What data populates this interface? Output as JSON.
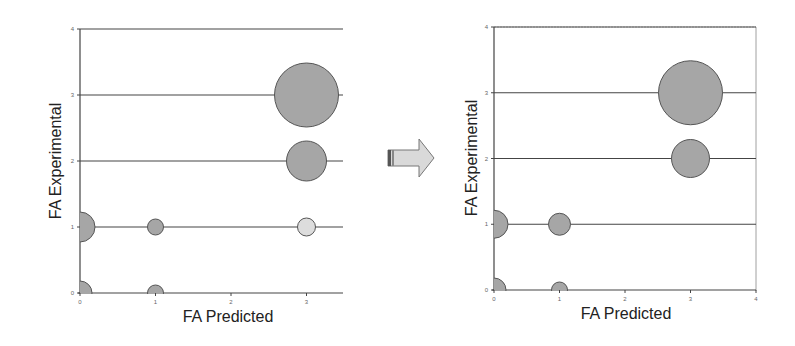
{
  "figure": {
    "arrow_icon": "right-arrow-icon",
    "colors": {
      "bubble_fill": "#a6a6a6",
      "bubble_fill_light": "#dddddd",
      "bubble_stroke": "#555555",
      "gridline": "#444444",
      "axis": "#444444",
      "arrow_fill": "#d9d9d9",
      "arrow_stroke": "#777777"
    }
  },
  "left_chart": {
    "xlabel": "FA Predicted",
    "ylabel": "FA Experimental",
    "xticks": [
      "0",
      "1",
      "2",
      "3"
    ],
    "yticks": [
      "0",
      "1",
      "2",
      "3",
      "4"
    ]
  },
  "right_chart": {
    "xlabel": "FA Predicted",
    "ylabel": "FA Experimental",
    "xticks": [
      "0",
      "1",
      "2",
      "3",
      "4"
    ],
    "yticks": [
      "0",
      "1",
      "2",
      "3",
      "4"
    ]
  },
  "chart_data": [
    {
      "type": "scatter",
      "subtype": "bubble",
      "title": "",
      "xlabel": "FA Predicted",
      "ylabel": "FA Experimental",
      "xlim": [
        0,
        3.5
      ],
      "ylim": [
        0,
        4
      ],
      "xticks": [
        0,
        1,
        2,
        3
      ],
      "yticks": [
        0,
        1,
        2,
        3,
        4
      ],
      "grid": "horizontal",
      "legend": null,
      "points": [
        {
          "x": 0,
          "y": 0,
          "size": 12,
          "shade": "gray"
        },
        {
          "x": 1,
          "y": 0,
          "size": 8,
          "shade": "gray"
        },
        {
          "x": 0,
          "y": 1,
          "size": 15,
          "shade": "gray"
        },
        {
          "x": 1,
          "y": 1,
          "size": 8,
          "shade": "gray"
        },
        {
          "x": 3,
          "y": 1,
          "size": 9,
          "shade": "light"
        },
        {
          "x": 3,
          "y": 2,
          "size": 20,
          "shade": "gray"
        },
        {
          "x": 3,
          "y": 3,
          "size": 32,
          "shade": "gray"
        }
      ]
    },
    {
      "type": "scatter",
      "subtype": "bubble",
      "title": "",
      "xlabel": "FA Predicted",
      "ylabel": "FA Experimental",
      "xlim": [
        0,
        4
      ],
      "ylim": [
        0,
        4
      ],
      "xticks": [
        0,
        1,
        2,
        3,
        4
      ],
      "yticks": [
        0,
        1,
        2,
        3,
        4
      ],
      "grid": "horizontal",
      "legend": null,
      "points": [
        {
          "x": 0,
          "y": 0,
          "size": 12,
          "shade": "gray"
        },
        {
          "x": 1,
          "y": 0,
          "size": 8,
          "shade": "gray"
        },
        {
          "x": 0,
          "y": 1,
          "size": 14,
          "shade": "gray"
        },
        {
          "x": 1,
          "y": 1,
          "size": 11,
          "shade": "gray"
        },
        {
          "x": 3,
          "y": 2,
          "size": 19,
          "shade": "gray"
        },
        {
          "x": 3,
          "y": 3,
          "size": 32,
          "shade": "gray"
        }
      ]
    }
  ]
}
